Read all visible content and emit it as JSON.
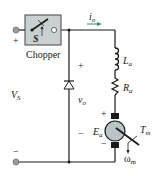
{
  "diagram": {
    "chopper": {
      "label": "Chopper",
      "switch_label": "S",
      "fill": "#c9d0d0"
    },
    "source": {
      "label": "V",
      "label_sub": "S",
      "plus": "+",
      "minus": "−"
    },
    "output_current": {
      "label": "i",
      "label_sub": "o",
      "arrow_color": "#2e8b7a"
    },
    "output_voltage": {
      "label": "v",
      "label_sub": "o",
      "plus": "+",
      "minus": "−"
    },
    "inductor": {
      "label": "L",
      "label_sub": "a"
    },
    "resistor": {
      "label": "R",
      "label_sub": "a"
    },
    "motor": {
      "emf_label": "E",
      "emf_sub": "a",
      "torque_label": "T",
      "torque_sub": "m",
      "speed_label": "ω",
      "speed_sub": "m",
      "plus": "+",
      "minus": "−",
      "fill": "#b8c4c6"
    },
    "colors": {
      "wire": "#1a1a1a",
      "terminal": "#9a9a9a"
    }
  }
}
